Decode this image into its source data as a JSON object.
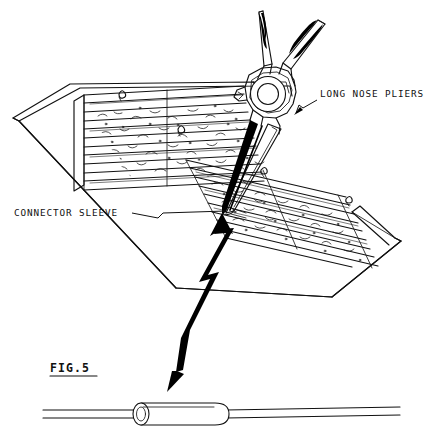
{
  "figure": {
    "label": "FIG.5",
    "domain": "patent-drawing",
    "background_color": "#ffffff",
    "ink_color": "#111111",
    "width": 437,
    "height": 438
  },
  "callouts": [
    {
      "id": "long-nose-pliers",
      "text": "LONG NOSE PLIERS",
      "text_x": 320,
      "text_y": 97,
      "anchor": "start",
      "leader_points": "317,100 303,108 299,105 296,113",
      "arrow_at": [
        296,
        113
      ],
      "arrow_angle": 230
    },
    {
      "id": "connector-sleeve",
      "text": "CONNECTOR SLEEVE",
      "text_x": 14,
      "text_y": 216,
      "anchor": "start",
      "leader_points": "132,213 158,218 163,213 226,211",
      "arrow_at": null,
      "arrow_angle": 0
    }
  ],
  "parts": {
    "pliers": {
      "name": "long nose pliers",
      "pivot_center": [
        268,
        94
      ],
      "pivot_outer_r": 17.5,
      "pivot_inner_r": 10.5,
      "jaw_tip": [
        222,
        214
      ],
      "handle_count": 2,
      "grip_texture": "hatched"
    },
    "terminal_block": {
      "name": "gel filled connector block",
      "channel_count": 5,
      "fill_texture": "stipple",
      "base_plate_corners": [
        [
          13,
          118
        ],
        [
          70,
          84
        ],
        [
          253,
          82
        ],
        [
          400,
          240
        ],
        [
          330,
          296
        ]
      ]
    },
    "connector_sleeve_detail": {
      "name": "connector sleeve with wire",
      "sleeve_x": 131,
      "sleeve_y": 403,
      "sleeve_w": 98,
      "sleeve_h": 22,
      "wire_left_end": 43,
      "wire_right_end": 400,
      "open_end": "left"
    },
    "action_arrow": {
      "name": "double headed break arrow",
      "head_top": [
        222,
        216
      ],
      "head_bottom": [
        167,
        391
      ],
      "style": "lightning-break"
    }
  }
}
